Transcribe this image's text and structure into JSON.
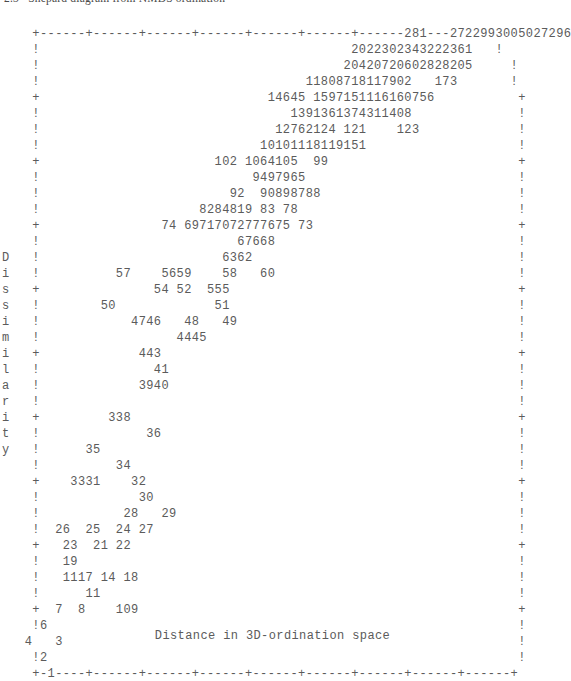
{
  "figure": {
    "title_clipped": "2.3   Shepard diagram from NMDS ordination",
    "xlabel": "Distance in 3D-ordination space",
    "ylabel": "Dissimilarity",
    "ylabel_chars": [
      "D",
      "i",
      "s",
      "s",
      "i",
      "m",
      "i",
      "l",
      "a",
      "r",
      "i",
      "t",
      "y"
    ],
    "axis_vertical_tick": "+",
    "axis_vertical_fill": "!",
    "axis_horizontal_tick": "+",
    "axis_horizontal_fill": "-",
    "text_color": "#5b5b5b",
    "background_color": "#ffffff"
  },
  "chart_data": {
    "type": "scatter",
    "title": "Shepard diagram from NMDS ordination",
    "xlabel": "Distance in 3D-ordination space",
    "ylabel": "Dissimilarity",
    "grid": false,
    "legend": null,
    "n_rows": 38,
    "n_cols": 68,
    "rows": [
      "    +------+------+------+------+------+------+------281---2722993005027296",
      "    !                                         2022302343222361   !",
      "    !                                        20420720602828205     !",
      "    !                                   11808718117902   173       !",
      "    +                              14645 1597151116160756           +",
      "    !                                 1391361374311408              !",
      "    !                               12762124 121    123             !",
      "    !                             10101118119151                    !",
      "    +                       102 1064105  99                         +",
      "    !                            9497965                            !",
      "    !                         92  90898788                          !",
      "    !                     8284819 83 78                             !",
      "    +                74 69717072777675 73                           +",
      "    !                          67668                                !",
      "D   !                        6362                                   !",
      "i   !          57    5659    58   60                                !",
      "s   +               54 52  555                                      +",
      "s   !        50             51                                      !",
      "i   !            4746   48   49                                     !",
      "m   !                  4445                                         !",
      "i   +             443                                               +",
      "l   !               41                                              !",
      "a   !             3940                                              !",
      "r   !                                                               !",
      "i   +         338                                                   +",
      "t   !              36                                               !",
      "y   !      35                                                       !",
      "    !          34                                                   !",
      "    +    3331    32                                                 +",
      "    !             30                                                !",
      "    !           28   29                                             !",
      "    !  26  25  24 27                                                !",
      "    +   23  21 22                                                   +",
      "    !   19                                                          !",
      "    !   1117 14 18                                                  !",
      "    !      11                                                       !",
      "    +  7  8    109                                                  +",
      "    !6                                                              !",
      "   4   3                                                            !",
      "    !2                                                              !",
      "    +-1----+------+------+------+------+------+------+------+------+"
    ],
    "point_labels": [
      "1",
      "2",
      "3",
      "4",
      "6",
      "7",
      "8",
      "9",
      "10",
      "11",
      "11",
      "14",
      "17",
      "18",
      "19",
      "21",
      "22",
      "23",
      "24",
      "25",
      "26",
      "27",
      "28",
      "29",
      "30",
      "31",
      "32",
      "33",
      "34",
      "35",
      "36",
      "38",
      "39",
      "40",
      "41",
      "43",
      "44",
      "45",
      "46",
      "47",
      "48",
      "49",
      "50",
      "51",
      "52",
      "54",
      "55",
      "55",
      "56",
      "57",
      "58",
      "59",
      "60",
      "62",
      "63",
      "66",
      "67",
      "68",
      "69",
      "70",
      "71",
      "72",
      "73",
      "74",
      "75",
      "76",
      "77",
      "78",
      "79",
      "82",
      "83",
      "84",
      "87",
      "88",
      "89",
      "90",
      "92",
      "94",
      "95",
      "96",
      "97",
      "99",
      "101",
      "102",
      "104",
      "105",
      "106",
      "108",
      "110",
      "111",
      "115",
      "118",
      "119",
      "121",
      "123",
      "124",
      "126",
      "127",
      "136",
      "137",
      "139",
      "141",
      "145",
      "146",
      "151",
      "152",
      "156",
      "160",
      "161",
      "163",
      "171",
      "173",
      "175",
      "179",
      "180",
      "181",
      "187",
      "202",
      "204",
      "205",
      "207",
      "206",
      "208",
      "220",
      "222",
      "228",
      "230",
      "232",
      "234",
      "236",
      "238",
      "243",
      "272",
      "281",
      "290",
      "292",
      "293",
      "296",
      "299",
      "300",
      "302",
      "304",
      "305",
      "307",
      "329"
    ],
    "xlim_label": "1",
    "x_axis_ticks": 9,
    "y_axis_ticks": 10
  }
}
